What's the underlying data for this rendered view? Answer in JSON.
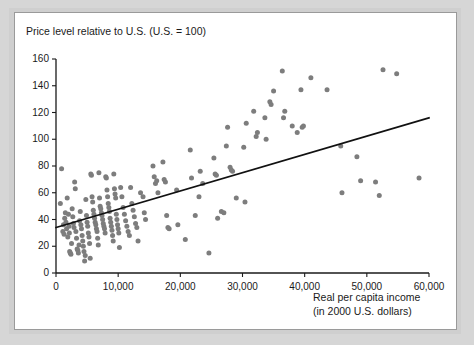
{
  "figure": {
    "name": "price-level-vs-income-scatter",
    "background_color": "#d6d6d6",
    "panel_color": "#ffffff",
    "border_color": "#9a9a9a"
  },
  "chart_data": {
    "type": "scatter",
    "title": "Price level relative to U.S. (U.S. = 100)",
    "xlabel": "Real per capita income",
    "xlabel_line2": "(in 2000 U.S. dollars)",
    "ylabel": "Price level relative to U.S. (U.S. = 100)",
    "xlim": [
      0,
      60000
    ],
    "ylim": [
      0,
      160
    ],
    "grid": false,
    "legend": "none",
    "point_color": "#7d7d7d",
    "line_color": "#111111",
    "xticks": [
      0,
      10000,
      20000,
      30000,
      40000,
      50000,
      60000
    ],
    "xticklabels": [
      "0",
      "10,000",
      "20,000",
      "30,000",
      "40,000",
      "50,000",
      "60,000"
    ],
    "yticks": [
      0,
      20,
      40,
      60,
      80,
      100,
      120,
      140,
      160
    ],
    "yticklabels": [
      "0",
      "20",
      "40",
      "60",
      "80",
      "100",
      "120",
      "140",
      "160"
    ],
    "trendline": {
      "label": "linear fit",
      "x": [
        0,
        60000
      ],
      "y": [
        34,
        116
      ]
    },
    "points": [
      [
        700,
        52
      ],
      [
        900,
        78
      ],
      [
        1100,
        31
      ],
      [
        1200,
        36
      ],
      [
        1300,
        29
      ],
      [
        1400,
        41
      ],
      [
        1500,
        45
      ],
      [
        1600,
        38
      ],
      [
        1700,
        33
      ],
      [
        1800,
        56
      ],
      [
        1900,
        27
      ],
      [
        2000,
        44
      ],
      [
        2100,
        35
      ],
      [
        2150,
        30
      ],
      [
        2200,
        16
      ],
      [
        2300,
        15
      ],
      [
        2400,
        14
      ],
      [
        2500,
        22
      ],
      [
        2600,
        48
      ],
      [
        2700,
        42
      ],
      [
        2800,
        37
      ],
      [
        2900,
        34
      ],
      [
        3000,
        68
      ],
      [
        3100,
        63
      ],
      [
        3200,
        31
      ],
      [
        3300,
        26
      ],
      [
        3400,
        18
      ],
      [
        3500,
        17
      ],
      [
        3600,
        15
      ],
      [
        3700,
        21
      ],
      [
        3800,
        39
      ],
      [
        3900,
        46
      ],
      [
        4000,
        36
      ],
      [
        4100,
        33
      ],
      [
        4200,
        28
      ],
      [
        4300,
        24
      ],
      [
        4400,
        20
      ],
      [
        4500,
        16
      ],
      [
        4600,
        9
      ],
      [
        4700,
        13
      ],
      [
        4800,
        55
      ],
      [
        4900,
        43
      ],
      [
        5000,
        38
      ],
      [
        5100,
        35
      ],
      [
        5200,
        30
      ],
      [
        5300,
        27
      ],
      [
        5400,
        22
      ],
      [
        5500,
        11
      ],
      [
        5600,
        74
      ],
      [
        5700,
        73
      ],
      [
        5800,
        57
      ],
      [
        5900,
        53
      ],
      [
        6000,
        47
      ],
      [
        6100,
        44
      ],
      [
        6200,
        41
      ],
      [
        6300,
        38
      ],
      [
        6400,
        36
      ],
      [
        6500,
        33
      ],
      [
        6600,
        31
      ],
      [
        6700,
        26
      ],
      [
        6800,
        21
      ],
      [
        6900,
        75
      ],
      [
        7000,
        56
      ],
      [
        7100,
        50
      ],
      [
        7200,
        48
      ],
      [
        7300,
        45
      ],
      [
        7400,
        43
      ],
      [
        7500,
        40
      ],
      [
        7600,
        37
      ],
      [
        7700,
        35
      ],
      [
        7800,
        33
      ],
      [
        7900,
        30
      ],
      [
        8000,
        72
      ],
      [
        8100,
        71
      ],
      [
        8200,
        62
      ],
      [
        8300,
        57
      ],
      [
        8400,
        52
      ],
      [
        8500,
        49
      ],
      [
        8600,
        46
      ],
      [
        8700,
        41
      ],
      [
        8800,
        38
      ],
      [
        8900,
        35
      ],
      [
        9000,
        32
      ],
      [
        9100,
        28
      ],
      [
        9200,
        24
      ],
      [
        9300,
        74
      ],
      [
        9400,
        63
      ],
      [
        9500,
        59
      ],
      [
        9600,
        56
      ],
      [
        9700,
        44
      ],
      [
        9800,
        40
      ],
      [
        9900,
        36
      ],
      [
        10000,
        33
      ],
      [
        10100,
        30
      ],
      [
        10200,
        19
      ],
      [
        10400,
        64
      ],
      [
        10600,
        57
      ],
      [
        10800,
        49
      ],
      [
        11000,
        44
      ],
      [
        11200,
        39
      ],
      [
        11400,
        35
      ],
      [
        11600,
        31
      ],
      [
        11800,
        28
      ],
      [
        12000,
        64
      ],
      [
        12200,
        52
      ],
      [
        12400,
        47
      ],
      [
        12600,
        42
      ],
      [
        12800,
        37
      ],
      [
        13000,
        34
      ],
      [
        13200,
        24
      ],
      [
        13600,
        60
      ],
      [
        14000,
        57
      ],
      [
        14200,
        45
      ],
      [
        14400,
        40
      ],
      [
        15600,
        80
      ],
      [
        15800,
        72
      ],
      [
        16000,
        67
      ],
      [
        16200,
        69
      ],
      [
        16400,
        60
      ],
      [
        17200,
        83
      ],
      [
        17400,
        70
      ],
      [
        17600,
        68
      ],
      [
        17800,
        43
      ],
      [
        18000,
        34
      ],
      [
        18200,
        33
      ],
      [
        19400,
        62
      ],
      [
        19600,
        36
      ],
      [
        20800,
        25
      ],
      [
        21600,
        92
      ],
      [
        21800,
        71
      ],
      [
        22400,
        43
      ],
      [
        23000,
        57
      ],
      [
        23200,
        76
      ],
      [
        23600,
        67
      ],
      [
        24600,
        15
      ],
      [
        25400,
        86
      ],
      [
        25600,
        74
      ],
      [
        25800,
        73
      ],
      [
        26000,
        41
      ],
      [
        26600,
        46
      ],
      [
        27000,
        45
      ],
      [
        27400,
        95
      ],
      [
        27600,
        109
      ],
      [
        28000,
        79
      ],
      [
        28200,
        77
      ],
      [
        28400,
        76
      ],
      [
        29000,
        56
      ],
      [
        30200,
        94
      ],
      [
        30400,
        53
      ],
      [
        30600,
        112
      ],
      [
        31800,
        121
      ],
      [
        32200,
        102
      ],
      [
        32400,
        105
      ],
      [
        33600,
        116
      ],
      [
        33800,
        100
      ],
      [
        34400,
        128
      ],
      [
        34600,
        126
      ],
      [
        35000,
        136
      ],
      [
        36400,
        151
      ],
      [
        36600,
        116
      ],
      [
        36800,
        121
      ],
      [
        38000,
        110
      ],
      [
        38800,
        105
      ],
      [
        39400,
        137
      ],
      [
        39600,
        109
      ],
      [
        39800,
        110
      ],
      [
        41000,
        146
      ],
      [
        43600,
        137
      ],
      [
        45800,
        95
      ],
      [
        46000,
        60
      ],
      [
        48400,
        87
      ],
      [
        49000,
        69
      ],
      [
        51400,
        68
      ],
      [
        52000,
        58
      ],
      [
        52600,
        152
      ],
      [
        54800,
        149
      ],
      [
        58400,
        71
      ]
    ]
  }
}
